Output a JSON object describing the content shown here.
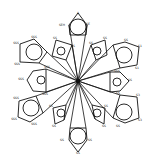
{
  "diagram": {
    "type": "radial-star",
    "center": {
      "x": 78,
      "y": 81
    },
    "stroke_color": "#111111",
    "background": "#ffffff",
    "large_lobes": [
      {
        "id": "top",
        "circle": {
          "cx": 78,
          "cy": 27,
          "r": 8
        },
        "poly": "69,25 78,13 87,25 86,35 70,35",
        "labels": [
          {
            "x": 62,
            "y": 26,
            "text": "SEH"
          },
          {
            "x": 88,
            "y": 25,
            "text": "SE"
          },
          {
            "x": 78,
            "y": 14,
            "text": "A"
          }
        ]
      },
      {
        "id": "upper-right",
        "circle": {
          "cx": 124,
          "cy": 55,
          "r": 8
        },
        "poly": "113,45 125,42 139,47 137,65 120,68",
        "labels": [
          {
            "x": 126,
            "y": 41,
            "text": "SS"
          },
          {
            "x": 140,
            "y": 47,
            "text": "S1"
          },
          {
            "x": 137,
            "y": 69,
            "text": "S1"
          }
        ]
      },
      {
        "id": "lower-right",
        "circle": {
          "cx": 124,
          "cy": 112,
          "r": 8
        },
        "poly": "120,95 137,97 139,118 125,123 113,118",
        "labels": [
          {
            "x": 138,
            "y": 96,
            "text": "S3"
          },
          {
            "x": 140,
            "y": 121,
            "text": "S3"
          },
          {
            "x": 118,
            "y": 127,
            "text": "SS"
          }
        ]
      },
      {
        "id": "bottom",
        "circle": {
          "cx": 78,
          "cy": 136,
          "r": 8
        },
        "poly": "70,128 86,128 87,140 78,152 69,140",
        "labels": [
          {
            "x": 62,
            "y": 141,
            "text": "SS"
          },
          {
            "x": 90,
            "y": 141,
            "text": "SS"
          },
          {
            "x": 78,
            "y": 154,
            "text": "SS"
          }
        ]
      },
      {
        "id": "lower-left",
        "circle": {
          "cx": 31,
          "cy": 108,
          "r": 8
        },
        "poly": "19,101 36,96 43,113 30,122 18,117",
        "labels": [
          {
            "x": 16,
            "y": 99,
            "text": "SSS"
          },
          {
            "x": 14,
            "y": 120,
            "text": "SSS"
          },
          {
            "x": 34,
            "y": 125,
            "text": "SSS"
          }
        ]
      },
      {
        "id": "upper-left",
        "circle": {
          "cx": 34,
          "cy": 52,
          "r": 8
        },
        "poly": "20,44 34,39 47,52 39,63 20,62",
        "labels": [
          {
            "x": 16,
            "y": 44,
            "text": "SSS"
          },
          {
            "x": 34,
            "y": 38,
            "text": "SSS"
          },
          {
            "x": 17,
            "y": 65,
            "text": "SSS"
          }
        ]
      }
    ],
    "small_lobes": [
      {
        "id": "upper-mid-left",
        "circle": {
          "cx": 61,
          "cy": 51,
          "r": 4
        },
        "poly": "56,40 72,45 66,60 52,56",
        "labels": [
          {
            "x": 55,
            "y": 39,
            "text": "SS"
          },
          {
            "x": 73,
            "y": 47,
            "text": "SS"
          }
        ]
      },
      {
        "id": "upper-mid-right",
        "circle": {
          "cx": 97,
          "cy": 51,
          "r": 4
        },
        "poly": "91,45 105,40 107,55 96,60",
        "labels": [
          {
            "x": 105,
            "y": 39,
            "text": "SS"
          },
          {
            "x": 91,
            "y": 44,
            "text": "SS"
          }
        ]
      },
      {
        "id": "right",
        "circle": {
          "cx": 117,
          "cy": 82,
          "r": 4
        },
        "poly": "110,72 120,72 129,81 120,91 110,92",
        "labels": [
          {
            "x": 117,
            "y": 72,
            "text": "SSS"
          },
          {
            "x": 130,
            "y": 81,
            "text": "SS"
          },
          {
            "x": 118,
            "y": 94,
            "text": "SS"
          }
        ]
      },
      {
        "id": "lower-mid-right",
        "circle": {
          "cx": 97,
          "cy": 113,
          "r": 4
        },
        "poly": "92,105 105,108 104,124 95,119",
        "labels": [
          {
            "x": 106,
            "y": 107,
            "text": "SS"
          },
          {
            "x": 104,
            "y": 127,
            "text": "SS"
          }
        ]
      },
      {
        "id": "lower-mid-left",
        "circle": {
          "cx": 61,
          "cy": 113,
          "r": 4
        },
        "poly": "53,108 66,105 64,120 55,124",
        "labels": [
          {
            "x": 51,
            "y": 107,
            "text": "SS"
          },
          {
            "x": 54,
            "y": 127,
            "text": "SS"
          }
        ]
      },
      {
        "id": "left",
        "circle": {
          "cx": 41,
          "cy": 80,
          "r": 4
        },
        "poly": "33,71 46,69 46,92 33,91 27,80",
        "labels": [
          {
            "x": 47,
            "y": 68,
            "text": "SSS"
          },
          {
            "x": 21,
            "y": 80,
            "text": "SSS"
          },
          {
            "x": 45,
            "y": 95,
            "text": "SSS"
          }
        ]
      }
    ],
    "spokes": [
      [
        69,
        25
      ],
      [
        87,
        25
      ],
      [
        113,
        45
      ],
      [
        120,
        68
      ],
      [
        110,
        72
      ],
      [
        110,
        92
      ],
      [
        113,
        118
      ],
      [
        120,
        95
      ],
      [
        86,
        128
      ],
      [
        70,
        128
      ],
      [
        43,
        113
      ],
      [
        36,
        96
      ],
      [
        46,
        69
      ],
      [
        46,
        92
      ],
      [
        47,
        52
      ],
      [
        39,
        63
      ],
      [
        72,
        45
      ],
      [
        66,
        60
      ],
      [
        91,
        45
      ],
      [
        96,
        60
      ],
      [
        92,
        105
      ],
      [
        95,
        119
      ],
      [
        66,
        105
      ],
      [
        64,
        120
      ]
    ]
  }
}
